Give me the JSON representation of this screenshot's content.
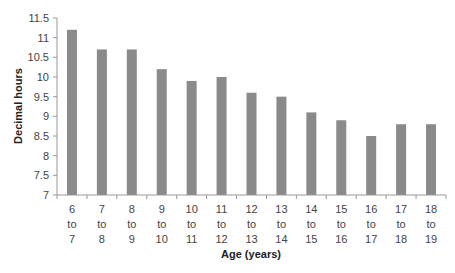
{
  "chart_data": {
    "type": "bar",
    "title": "",
    "xlabel": "Age (years)",
    "ylabel": "Decimal hours",
    "ylim": [
      7,
      11.5
    ],
    "yticks": [
      7,
      7.5,
      8,
      8.5,
      9,
      9.5,
      10,
      10.5,
      11,
      11.5
    ],
    "grid": false,
    "legend": null,
    "bar_color": "#8a8a8a",
    "categories": [
      [
        "6",
        "to",
        "7"
      ],
      [
        "7",
        "to",
        "8"
      ],
      [
        "8",
        "to",
        "9"
      ],
      [
        "9",
        "to",
        "10"
      ],
      [
        "10",
        "to",
        "11"
      ],
      [
        "11",
        "to",
        "12"
      ],
      [
        "12",
        "to",
        "13"
      ],
      [
        "13",
        "to",
        "14"
      ],
      [
        "14",
        "to",
        "15"
      ],
      [
        "15",
        "to",
        "16"
      ],
      [
        "16",
        "to",
        "17"
      ],
      [
        "17",
        "to",
        "18"
      ],
      [
        "18",
        "to",
        "19"
      ]
    ],
    "values": [
      11.2,
      10.7,
      10.7,
      10.2,
      9.9,
      10.0,
      9.6,
      9.5,
      9.1,
      8.9,
      8.5,
      8.8,
      8.8
    ]
  }
}
